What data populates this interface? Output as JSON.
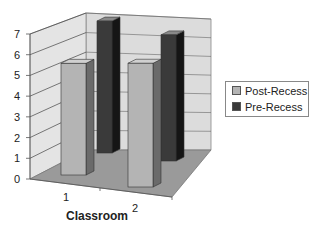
{
  "chart_data": {
    "type": "bar",
    "subtype": "3d-clustered-column",
    "title": "",
    "xlabel": "Classroom",
    "ylabel": "",
    "categories": [
      "1",
      "2"
    ],
    "series": [
      {
        "name": "Post-Recess",
        "values": [
          5.5,
          5.5
        ],
        "color": "#b4b4b4"
      },
      {
        "name": "Pre-Recess",
        "values": [
          6.8,
          6.5
        ],
        "color": "#3a3a3a"
      }
    ],
    "ylim": [
      0,
      7
    ],
    "yticks": [
      "0",
      "1",
      "2",
      "3",
      "4",
      "5",
      "6",
      "7"
    ],
    "grid": true,
    "legend_position": "right"
  },
  "legend": {
    "items": [
      {
        "label": "Post-Recess",
        "color": "#b4b4b4"
      },
      {
        "label": "Pre-Recess",
        "color": "#3a3a3a"
      }
    ]
  },
  "axis": {
    "xlabel": "Classroom",
    "categories": [
      "1",
      "2"
    ],
    "yticks": [
      "0",
      "1",
      "2",
      "3",
      "4",
      "5",
      "6",
      "7"
    ]
  }
}
